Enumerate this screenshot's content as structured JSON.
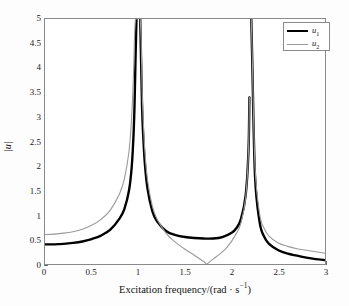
{
  "chart_data": {
    "type": "line",
    "title": "",
    "xlabel": "Excitation frequency/(rad · s⁻¹)",
    "ylabel": "|u|",
    "xlim": [
      0,
      3
    ],
    "ylim": [
      0,
      5
    ],
    "xticks": [
      "0",
      "0.5",
      "1",
      "1.5",
      "2",
      "2.5",
      "3"
    ],
    "xtick_values": [
      0,
      0.5,
      1,
      1.5,
      2,
      2.5,
      3
    ],
    "yticks": [
      "0",
      "0.5",
      "1",
      "1.5",
      "2",
      "2.5",
      "3",
      "3.5",
      "4",
      "4.5",
      "5"
    ],
    "ytick_values": [
      0,
      0.5,
      1,
      1.5,
      2,
      2.5,
      3,
      3.5,
      4,
      4.5,
      5
    ],
    "grid": false,
    "legend_position": "upper-right",
    "resonances": [
      1.0,
      2.2
    ],
    "antiresonance": 1.732,
    "series": [
      {
        "name": "u1",
        "legend_label": "u₁",
        "color": "#000000",
        "linewidth": 2.4,
        "style": "solid",
        "value_at_0": 0.4,
        "local_min": {
          "x": 1.78,
          "y": 0.52
        },
        "value_at_3": 0.08,
        "x": [
          0,
          0.1,
          0.2,
          0.3,
          0.4,
          0.5,
          0.6,
          0.7,
          0.8,
          0.85,
          0.9,
          0.93,
          0.95,
          0.96,
          0.97,
          0.98,
          1.02,
          1.03,
          1.04,
          1.05,
          1.07,
          1.1,
          1.15,
          1.2,
          1.3,
          1.4,
          1.5,
          1.6,
          1.7,
          1.8,
          1.9,
          2.0,
          2.05,
          2.1,
          2.15,
          2.18,
          2.19,
          2.21,
          2.22,
          2.25,
          2.3,
          2.35,
          2.4,
          2.5,
          2.6,
          2.7,
          2.8,
          2.9,
          3.0
        ],
        "y": [
          0.4,
          0.4,
          0.41,
          0.43,
          0.46,
          0.51,
          0.58,
          0.7,
          0.93,
          1.12,
          1.5,
          2.0,
          2.7,
          3.3,
          4.2,
          5.0,
          5.0,
          4.1,
          3.2,
          2.7,
          2.05,
          1.52,
          1.08,
          0.87,
          0.67,
          0.59,
          0.55,
          0.53,
          0.52,
          0.52,
          0.55,
          0.64,
          0.73,
          0.92,
          1.4,
          2.3,
          3.4,
          5.0,
          4.2,
          1.8,
          0.85,
          0.55,
          0.41,
          0.28,
          0.21,
          0.17,
          0.13,
          0.1,
          0.08
        ]
      },
      {
        "name": "u2",
        "legend_label": "u₂",
        "color": "#9a9a9a",
        "linewidth": 1.1,
        "style": "solid",
        "value_at_0": 0.6,
        "antiresonance": {
          "x": 1.732,
          "y": 0.0
        },
        "value_at_3": 0.22,
        "x": [
          0,
          0.1,
          0.2,
          0.3,
          0.4,
          0.5,
          0.6,
          0.7,
          0.8,
          0.85,
          0.9,
          0.93,
          0.95,
          0.96,
          0.97,
          0.98,
          1.02,
          1.03,
          1.04,
          1.05,
          1.07,
          1.1,
          1.15,
          1.2,
          1.3,
          1.4,
          1.5,
          1.6,
          1.7,
          1.732,
          1.78,
          1.85,
          1.95,
          2.05,
          2.1,
          2.15,
          2.18,
          2.19,
          2.21,
          2.22,
          2.25,
          2.3,
          2.35,
          2.4,
          2.5,
          2.6,
          2.7,
          2.8,
          2.9,
          3.0
        ],
        "y": [
          0.6,
          0.61,
          0.63,
          0.66,
          0.71,
          0.79,
          0.91,
          1.1,
          1.44,
          1.73,
          2.3,
          3.05,
          4.0,
          4.7,
          5.0,
          5.0,
          5.0,
          4.6,
          3.6,
          3.05,
          2.3,
          1.7,
          1.18,
          0.92,
          0.62,
          0.44,
          0.3,
          0.18,
          0.05,
          0.0,
          0.07,
          0.17,
          0.34,
          0.62,
          0.84,
          1.35,
          2.3,
          3.4,
          5.0,
          4.3,
          2.0,
          1.02,
          0.72,
          0.57,
          0.43,
          0.36,
          0.31,
          0.28,
          0.25,
          0.22
        ]
      }
    ]
  },
  "axis": {
    "ylabel_text": "|u|",
    "xlabel_prefix": "Excitation frequency/(rad · s",
    "xlabel_exponent": "−1",
    "xlabel_suffix": ")"
  },
  "legend": {
    "entries": [
      {
        "label": "u",
        "sub": "1"
      },
      {
        "label": "u",
        "sub": "2"
      }
    ]
  }
}
